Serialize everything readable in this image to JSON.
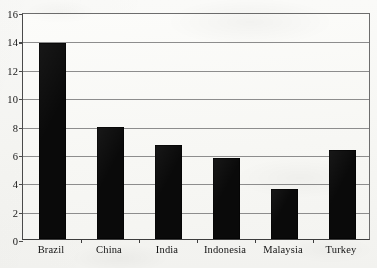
{
  "chart_data": {
    "type": "bar",
    "title": "",
    "subtitle": "",
    "xlabel": "",
    "ylabel": "",
    "categories": [
      "Brazil",
      "China",
      "India",
      "Indonesia",
      "Malaysia",
      "Turkey"
    ],
    "values": [
      13.8,
      7.9,
      6.6,
      5.7,
      3.55,
      6.3
    ],
    "series": [
      {
        "name": "",
        "values": [
          13.8,
          7.9,
          6.6,
          5.7,
          3.55,
          6.3
        ]
      }
    ],
    "ylim": [
      0,
      16
    ],
    "ytick_step": 2,
    "ytick_labels": [
      "0",
      "2",
      "4",
      "6",
      "8",
      "10",
      "12",
      "14",
      "16"
    ],
    "ytick_values": [
      0,
      2,
      4,
      6,
      8,
      10,
      12,
      14,
      16
    ],
    "grid": true,
    "grid_axis": "y",
    "legend": false,
    "legend_position": "none",
    "bar_color": "#0a0a0a",
    "grid_color": "#8d8d8d",
    "axis_color": "#3d3d3d",
    "background_color": "#f7f7f4",
    "annotations": []
  }
}
